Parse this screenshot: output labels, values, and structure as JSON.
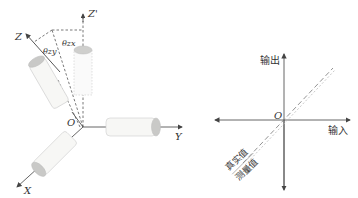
{
  "left_diagram": {
    "axes": {
      "z_prime": "Z'",
      "z": "Z",
      "y": "Y",
      "x": "X",
      "origin": "O"
    },
    "angles": {
      "theta_zy": "θzy",
      "theta_zx": "θzx"
    },
    "colors": {
      "cylinder_fill": "#f6f6f4",
      "cylinder_cap": "#c8c8c6",
      "axis": "#555555"
    }
  },
  "right_diagram": {
    "axes": {
      "output": "输出",
      "input": "输入",
      "origin": "O"
    },
    "legend": {
      "true_value": "真实值",
      "measured_value": "测量值"
    },
    "colors": {
      "axis": "#555555",
      "true_line": "#777777",
      "measured_line": "#bbbbbb"
    }
  }
}
